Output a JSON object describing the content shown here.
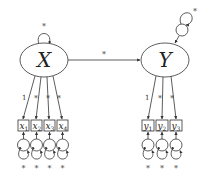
{
  "diagram": {
    "type": "structural-equation-model",
    "latent": [
      {
        "id": "X",
        "label": "X",
        "variance_label": "*"
      },
      {
        "id": "Y",
        "label": "Y",
        "disturbance_variance_label": "*"
      }
    ],
    "structural_path": {
      "from": "X",
      "to": "Y",
      "label": "*"
    },
    "indicators_x": [
      {
        "label": "x",
        "sub": "1",
        "loading": "1",
        "error_variance": "*"
      },
      {
        "label": "x",
        "sub": "2",
        "loading": "*",
        "error_variance": "*"
      },
      {
        "label": "x",
        "sub": "3",
        "loading": "*",
        "error_variance": "*"
      },
      {
        "label": "x",
        "sub": "4",
        "loading": "*",
        "error_variance": "*"
      }
    ],
    "indicators_y": [
      {
        "label": "y",
        "sub": "1",
        "loading": "1",
        "error_variance": "*"
      },
      {
        "label": "y",
        "sub": "2",
        "loading": "*",
        "error_variance": "*"
      },
      {
        "label": "y",
        "sub": "3",
        "loading": "*",
        "error_variance": "*"
      }
    ],
    "colors": {
      "stroke": "#333333",
      "background": "#ffffff"
    }
  }
}
